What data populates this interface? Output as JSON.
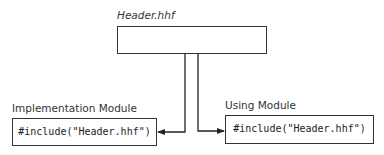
{
  "diagram": {
    "header": {
      "title": "Header.hhf"
    },
    "implementation": {
      "label": "Implementation Module",
      "code": "#include(\"Header.hhf\")"
    },
    "using": {
      "label": "Using Module",
      "code": "#include(\"Header.hhf\")"
    },
    "arrows": [
      {
        "from": "header",
        "to": "implementation"
      },
      {
        "from": "header",
        "to": "using"
      }
    ]
  }
}
